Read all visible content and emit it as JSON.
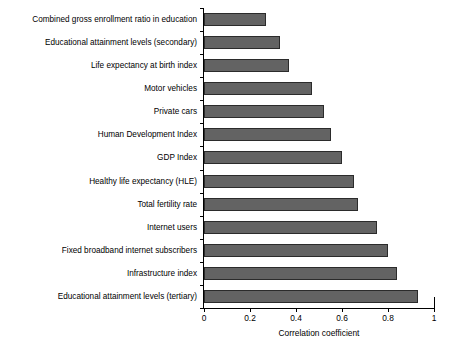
{
  "chart_data": {
    "type": "bar",
    "orientation": "horizontal",
    "title": "",
    "xlabel": "Correlation coefficient",
    "ylabel": "",
    "xlim": [
      0,
      1
    ],
    "xticks": [
      "0",
      "0.2",
      "0.4",
      "0.6",
      "0.8",
      "1"
    ],
    "xtick_values": [
      0,
      0.2,
      0.4,
      0.6,
      0.8,
      1
    ],
    "grid": false,
    "legend": "none",
    "bar_color": "#636363",
    "bar_edge_color": "#2b2b2b",
    "categories": [
      "Combined gross enrollment ratio in education",
      "Educational attainment levels (secondary)",
      "Life expectancy at birth index",
      "Motor vehicles",
      "Private cars",
      "Human Development Index",
      "GDP Index",
      "Healthy life expectancy (HLE)",
      "Total fertility rate",
      "Internet users",
      "Fixed broadband internet subscribers",
      "Infrastructure index",
      "Educational attainment levels (tertiary)"
    ],
    "values": [
      0.27,
      0.33,
      0.37,
      0.47,
      0.52,
      0.55,
      0.6,
      0.65,
      0.67,
      0.75,
      0.8,
      0.84,
      0.93
    ]
  }
}
